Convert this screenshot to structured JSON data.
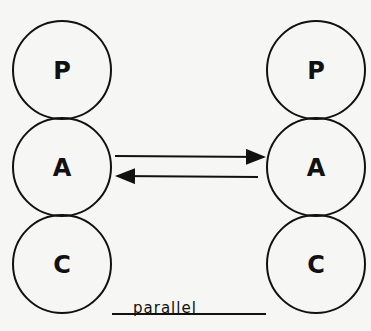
{
  "diagram": {
    "type": "transactional-analysis",
    "left_person": {
      "states": [
        {
          "label": "P",
          "cx": 62,
          "cy": 70,
          "r": 49
        },
        {
          "label": "A",
          "cx": 62,
          "cy": 167,
          "r": 49
        },
        {
          "label": "C",
          "cx": 62,
          "cy": 264,
          "r": 49
        }
      ]
    },
    "right_person": {
      "states": [
        {
          "label": "P",
          "cx": 316,
          "cy": 70,
          "r": 49
        },
        {
          "label": "A",
          "cx": 316,
          "cy": 167,
          "r": 49
        },
        {
          "label": "C",
          "cx": 316,
          "cy": 264,
          "r": 49
        }
      ]
    },
    "arrows": [
      {
        "from": "left.A",
        "to": "right.A",
        "direction": "right"
      },
      {
        "from": "right.A",
        "to": "left.A",
        "direction": "left"
      }
    ],
    "caption": "parallel",
    "stroke_color": "#111111",
    "background": "#f6f6f4"
  }
}
